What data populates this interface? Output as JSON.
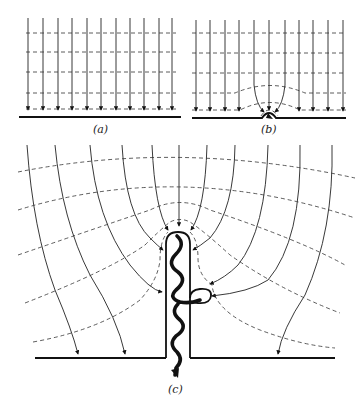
{
  "figure": {
    "panels": [
      {
        "id": "a",
        "label": "(a)",
        "caption": "Uniform field above flat ground"
      },
      {
        "id": "b",
        "label": "(b)",
        "caption": "Field distorted by small bump on ground"
      },
      {
        "id": "c",
        "label": "(c)",
        "caption": "Field concentrated at tip of tall conducting rod with discharge streamer"
      }
    ]
  },
  "legend": {
    "field_line_style": "solid with arrowheads",
    "equipotential_style": "dashed"
  }
}
